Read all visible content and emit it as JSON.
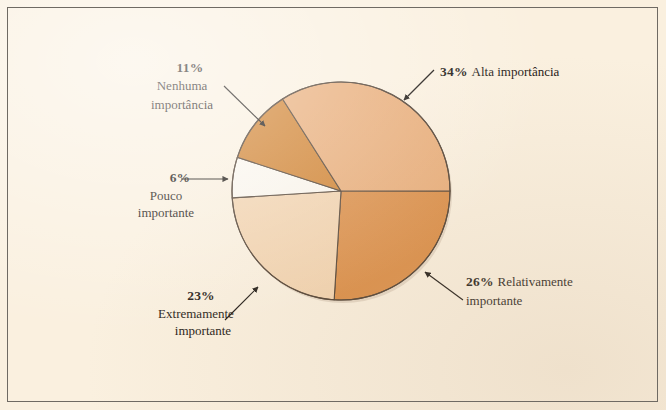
{
  "figure": {
    "background_color": "#faf0df",
    "frame_color": "#6f6a63",
    "outline_color": "#4a3a2c"
  },
  "chart_data": {
    "type": "pie",
    "title": "",
    "subtitle": "",
    "xlabel": "",
    "ylabel": "",
    "grid": false,
    "legend_position": "callout-labels",
    "center": {
      "x": 341,
      "y": 191
    },
    "radius": 109,
    "start_angle_deg": 0,
    "direction": "counterclockwise",
    "total_pct": 100,
    "labels": [
      "Alta importância",
      "Nenhuma importância",
      "Pouco importante",
      "Extremamente importante",
      "Relativamente importante"
    ],
    "values": [
      34,
      11,
      6,
      23,
      26
    ],
    "value_labels": [
      "34%",
      "11%",
      "6%",
      "23%",
      "26%"
    ],
    "colors": [
      "#e8ab76",
      "#cf7f2b",
      "#fbf7ef",
      "#f2d3af",
      "#da8b43"
    ],
    "slices": [
      {
        "key": "alta",
        "value": 34,
        "value_label": "34%",
        "label_line1": "Alta importância",
        "label_line2": "",
        "color": "#e8ab76",
        "start_deg": 0,
        "end_deg": 122.4
      },
      {
        "key": "nenhuma",
        "value": 11,
        "value_label": "11%",
        "label_line1": "Nenhuma",
        "label_line2": "importância",
        "color": "#cf7f2b",
        "start_deg": 122.4,
        "end_deg": 162.0
      },
      {
        "key": "pouco",
        "value": 6,
        "value_label": "6%",
        "label_line1": "Pouco",
        "label_line2": "importante",
        "color": "#fbf7ef",
        "start_deg": 162.0,
        "end_deg": 183.6
      },
      {
        "key": "extremamente",
        "value": 23,
        "value_label": "23%",
        "label_line1": "Extremamente",
        "label_line2": "importante",
        "color": "#f2d3af",
        "start_deg": 183.6,
        "end_deg": 266.4
      },
      {
        "key": "relativamente",
        "value": 26,
        "value_label": "26%",
        "label_line1": "Relativamente",
        "label_line2": "importante",
        "color": "#da8b43",
        "start_deg": 266.4,
        "end_deg": 360.0
      }
    ]
  }
}
